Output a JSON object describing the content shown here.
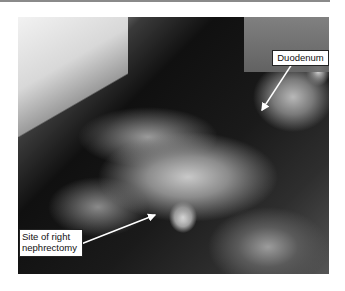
{
  "figure": {
    "annotations": [
      {
        "id": "duodenum",
        "label": "Duodenum"
      },
      {
        "id": "nephrectomy",
        "label_line1": "Site of right",
        "label_line2": "nephrectomy"
      }
    ]
  }
}
